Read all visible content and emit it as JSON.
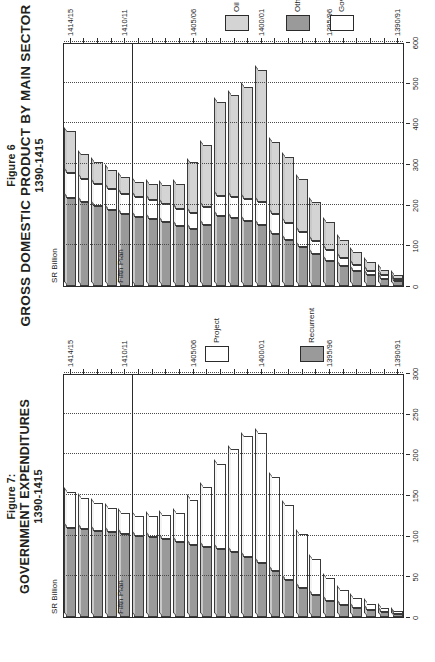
{
  "page": {
    "width": 435,
    "height": 662,
    "orientation": "landscape-figures-rotated"
  },
  "figures": [
    {
      "id": "fig6",
      "figure_label": "Figure 6",
      "title": "GROSS DOMESTIC PRODUCT BY MAIN SECTOR",
      "subtitle": "1390-1415",
      "axis_caption": "SR Billion",
      "plan_label": "Fifth Plan",
      "legend": [
        {
          "name": "Oil",
          "color": "#d4d4d4"
        },
        {
          "name": "Other Sectors",
          "color": "#9a9a9a"
        },
        {
          "name": "Government",
          "color": "#ffffff"
        }
      ]
    },
    {
      "id": "fig7",
      "figure_label": "Figure 7:",
      "title": "GOVERNMENT EXPENDITURES",
      "subtitle": "1390-1415",
      "axis_caption": "SR Billion",
      "plan_label": "Fifth Plan",
      "legend": [
        {
          "name": "Recurrent",
          "color": "#9a9a9a"
        },
        {
          "name": "Project",
          "color": "#ffffff"
        }
      ]
    }
  ],
  "chart_data": [
    {
      "type": "bar",
      "orientation": "horizontal",
      "stacked": true,
      "title": "GROSS DOMESTIC PRODUCT BY MAIN SECTOR",
      "subtitle": "1390-1415",
      "xlabel": "SR Billion",
      "ylabel": "",
      "xlim": [
        0,
        600
      ],
      "xticks": [
        0,
        100,
        200,
        300,
        400,
        500,
        600
      ],
      "grid": "vertical-dotted",
      "legend_position": "bottom-right",
      "annotation": "Fifth Plan",
      "annotation_after_category": "1410/11",
      "categories": [
        "1390/91",
        "1391/92",
        "1392/93",
        "1393/94",
        "1394/95",
        "1395/96",
        "1396/97",
        "1397/98",
        "1398/99",
        "1399/00",
        "1400/01",
        "1401/02",
        "1402/03",
        "1403/04",
        "1404/05",
        "1405/06",
        "1406/07",
        "1407/08",
        "1408/09",
        "1409/10",
        "1410/11",
        "1411/12",
        "1412/13",
        "1413/14",
        "1414/15"
      ],
      "tick_categories": [
        "1390/91",
        "1395/96",
        "1400/01",
        "1405/06",
        "1410/11",
        "1414/15"
      ],
      "series": [
        {
          "name": "Other Sectors",
          "color": "#9a9a9a",
          "values": [
            12,
            18,
            26,
            36,
            48,
            62,
            78,
            96,
            112,
            128,
            150,
            160,
            168,
            172,
            150,
            140,
            148,
            158,
            165,
            170,
            176,
            186,
            196,
            206,
            216
          ]
        },
        {
          "name": "Government",
          "color": "#ffffff",
          "values": [
            6,
            8,
            11,
            15,
            20,
            26,
            32,
            38,
            44,
            50,
            56,
            54,
            52,
            50,
            44,
            40,
            42,
            44,
            46,
            48,
            50,
            52,
            55,
            58,
            62
          ]
        },
        {
          "name": "Oil",
          "color": "#d4d4d4",
          "values": [
            10,
            14,
            22,
            32,
            46,
            70,
            96,
            130,
            162,
            176,
            324,
            276,
            250,
            230,
            152,
            124,
            62,
            46,
            40,
            38,
            42,
            48,
            54,
            60,
            102
          ]
        }
      ],
      "totals": [
        28,
        40,
        59,
        83,
        114,
        158,
        206,
        264,
        318,
        354,
        530,
        490,
        470,
        452,
        346,
        304,
        252,
        248,
        251,
        256,
        268,
        286,
        305,
        324,
        380
      ]
    },
    {
      "type": "bar",
      "orientation": "horizontal",
      "stacked": true,
      "title": "GOVERNMENT EXPENDITURES",
      "subtitle": "1390-1415",
      "xlabel": "SR Billion",
      "ylabel": "",
      "xlim": [
        0,
        300
      ],
      "xticks": [
        0,
        50,
        100,
        150,
        200,
        250,
        300
      ],
      "grid": "vertical-dotted",
      "legend_position": "bottom-right",
      "annotation": "Fifth Plan",
      "annotation_after_category": "1410/11",
      "categories": [
        "1390/91",
        "1391/92",
        "1392/93",
        "1393/94",
        "1394/95",
        "1395/96",
        "1396/97",
        "1397/98",
        "1398/99",
        "1399/00",
        "1400/01",
        "1401/02",
        "1402/03",
        "1403/04",
        "1404/05",
        "1405/06",
        "1406/07",
        "1407/08",
        "1408/09",
        "1409/10",
        "1410/11",
        "1411/12",
        "1412/13",
        "1413/14",
        "1414/15"
      ],
      "tick_categories": [
        "1390/91",
        "1395/96",
        "1400/01",
        "1405/06",
        "1410/11",
        "1414/15"
      ],
      "series": [
        {
          "name": "Recurrent",
          "color": "#9a9a9a",
          "values": [
            4,
            6,
            8,
            11,
            15,
            20,
            27,
            36,
            46,
            56,
            66,
            74,
            80,
            84,
            86,
            88,
            92,
            96,
            98,
            100,
            102,
            104,
            106,
            108,
            110
          ]
        },
        {
          "name": "Project",
          "color": "#ffffff",
          "values": [
            3,
            5,
            8,
            12,
            18,
            28,
            44,
            66,
            92,
            116,
            160,
            148,
            126,
            104,
            74,
            56,
            36,
            30,
            26,
            24,
            26,
            30,
            34,
            38,
            44
          ]
        }
      ],
      "totals": [
        7,
        11,
        16,
        23,
        33,
        48,
        71,
        102,
        138,
        172,
        226,
        222,
        206,
        188,
        160,
        144,
        128,
        126,
        124,
        124,
        128,
        134,
        140,
        146,
        154
      ]
    }
  ]
}
